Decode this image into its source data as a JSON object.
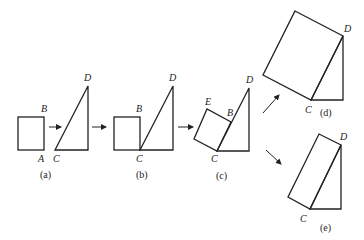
{
  "diagram": {
    "stroke_color": "#222222",
    "background": "#ffffff",
    "panels": [
      {
        "id": "a",
        "caption": "(a)",
        "labels": {
          "B": "B",
          "A": "A",
          "C": "C",
          "D": "D"
        }
      },
      {
        "id": "b",
        "caption": "(b)",
        "labels": {
          "B": "B",
          "C": "C",
          "D": "D"
        }
      },
      {
        "id": "c",
        "caption": "(c)",
        "labels": {
          "E": "E",
          "B": "B",
          "C": "C",
          "D": "D"
        }
      },
      {
        "id": "d",
        "caption": "(d)",
        "labels": {
          "C": "C",
          "D": "D"
        }
      },
      {
        "id": "e",
        "caption": "(e)",
        "labels": {
          "C": "C",
          "D": "D"
        }
      }
    ]
  }
}
